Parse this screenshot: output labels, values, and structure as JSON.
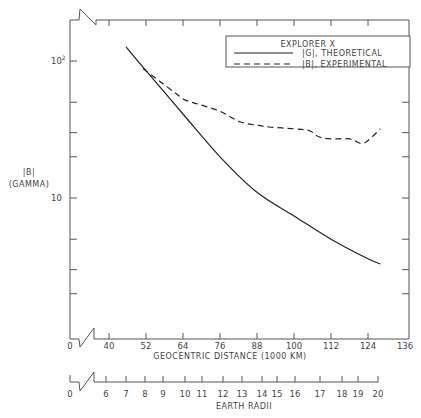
{
  "chart_data": {
    "type": "line",
    "title": "",
    "legend": {
      "title": "EXPLORER X",
      "position": "top-right",
      "entries": [
        {
          "label": "|G|, THEORETICAL",
          "style": "solid"
        },
        {
          "label": "|B|, EXPERIMENTAL",
          "style": "dashed"
        }
      ]
    },
    "xlabel": "GEOCENTRIC DISTANCE (1000 KM)",
    "x2label": "EARTH RADII",
    "ylabel": "|B|",
    "ylabel_unit": "(GAMMA)",
    "yscale": "log",
    "xlim": [
      0,
      136
    ],
    "ylim": [
      1,
      150
    ],
    "x_ticks": [
      "0",
      "40",
      "52",
      "64",
      "76",
      "88",
      "100",
      "112",
      "124",
      "136"
    ],
    "x2_ticks": [
      "0",
      "6",
      "7",
      "8",
      "9",
      "10",
      "11",
      "12",
      "13",
      "14",
      "15",
      "16",
      "17",
      "18",
      "19",
      "20"
    ],
    "y_ticks": [
      "10",
      "10²"
    ],
    "series": [
      {
        "name": "|G|, THEORETICAL",
        "x": [
          45.5,
          52,
          64,
          76,
          88,
          100,
          112,
          124,
          128
        ],
        "values": [
          127,
          85,
          41,
          20,
          11,
          7.4,
          5.0,
          3.6,
          3.3
        ]
      },
      {
        "name": "|B|, EXPERIMENTAL",
        "x": [
          51,
          56.5,
          61.7,
          64.6,
          69.5,
          76,
          82.5,
          88,
          92,
          100,
          105,
          108,
          112,
          118,
          122,
          124.6,
          128
        ],
        "values": [
          88,
          71,
          58,
          52,
          48,
          43,
          36,
          34,
          33,
          32,
          31,
          28,
          27,
          27,
          25,
          27,
          32
        ]
      }
    ]
  },
  "labels": {
    "legend_title": "EXPLORER X",
    "legend_solid": "|G|, THEORETICAL",
    "legend_dashed": "|B|, EXPERIMENTAL",
    "ylabel": "|B|",
    "ylabel_unit": "(GAMMA)",
    "y_tick_10": "10",
    "y_tick_100_base": "10",
    "y_tick_100_exp": "2",
    "xlabel": "GEOCENTRIC DISTANCE (1000 KM)",
    "x2label": "EARTH RADII",
    "x_zero": "0",
    "x2_zero": "0"
  }
}
